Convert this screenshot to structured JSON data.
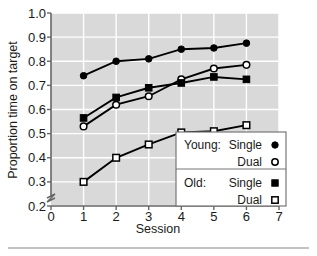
{
  "chart_data": {
    "type": "line",
    "title": "",
    "xlabel": "Session",
    "ylabel": "Proportion time on target",
    "xlim": [
      0,
      7
    ],
    "ylim": [
      0.2,
      1.0
    ],
    "xticks": [
      "0",
      "1",
      "2",
      "3",
      "4",
      "5",
      "6",
      "7"
    ],
    "yticks": [
      "0.2",
      "0.3",
      "0.4",
      "0.5",
      "0.6",
      "0.7",
      "0.8",
      "0.9",
      "1.0"
    ],
    "grid": true,
    "y_axis_break": true,
    "legend_position": "lower-right",
    "x": [
      1,
      2,
      3,
      4,
      5,
      6
    ],
    "series": [
      {
        "name": "Young: Single",
        "group": "Young",
        "condition": "Single",
        "marker": "filled-circle",
        "values": [
          0.74,
          0.8,
          0.81,
          0.85,
          0.855,
          0.875
        ]
      },
      {
        "name": "Young: Dual",
        "group": "Young",
        "condition": "Dual",
        "marker": "open-circle",
        "values": [
          0.53,
          0.62,
          0.655,
          0.725,
          0.77,
          0.785
        ]
      },
      {
        "name": "Old: Single",
        "group": "Old",
        "condition": "Single",
        "marker": "filled-square",
        "values": [
          0.565,
          0.65,
          0.69,
          0.71,
          0.735,
          0.725
        ]
      },
      {
        "name": "Old: Dual",
        "group": "Old",
        "condition": "Dual",
        "marker": "open-square",
        "values": [
          0.3,
          0.4,
          0.455,
          0.505,
          0.51,
          0.535
        ]
      }
    ],
    "colors": {
      "plot_background": "#d9d9d9",
      "gridline": "#ffffff",
      "line": "#000000",
      "axis": "#555555",
      "legend_background": "#ffffff"
    }
  },
  "legend": {
    "rows": [
      {
        "group_label": "Young:",
        "condition_label": "Single",
        "marker": "filled-circle"
      },
      {
        "group_label": "",
        "condition_label": "Dual",
        "marker": "open-circle"
      },
      {
        "group_label": "Old:",
        "condition_label": "Single",
        "marker": "filled-square"
      },
      {
        "group_label": "",
        "condition_label": "Dual",
        "marker": "open-square"
      }
    ]
  }
}
